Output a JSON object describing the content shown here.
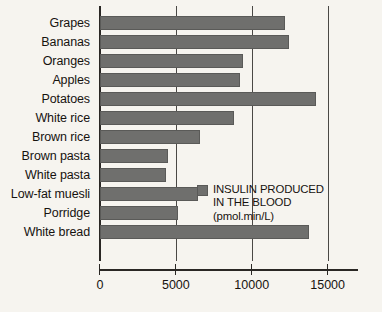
{
  "chart_data": {
    "type": "bar",
    "orientation": "horizontal",
    "title": "",
    "xlabel": "",
    "ylabel": "",
    "xlim": [
      0,
      17000
    ],
    "xticks": [
      0,
      5000,
      10000,
      15000
    ],
    "xtick_labels": [
      "0",
      "5000",
      "10000",
      "15000"
    ],
    "grid": "vertical",
    "legend_position": "inside-right",
    "categories": [
      "Grapes",
      "Bananas",
      "Oranges",
      "Apples",
      "Potatoes",
      "White rice",
      "Brown rice",
      "Brown pasta",
      "White pasta",
      "Low-fat muesli",
      "Porridge",
      "White bread"
    ],
    "values": [
      12200,
      12450,
      9450,
      9200,
      14200,
      8800,
      6600,
      4500,
      4350,
      6450,
      5150,
      13800
    ],
    "series": [
      {
        "name": "INSULIN PRODUCED IN THE BLOOD (pmol.min/L)",
        "color": "#6f6f6d",
        "values": [
          12200,
          12450,
          9450,
          9200,
          14200,
          8800,
          6600,
          4500,
          4350,
          6450,
          5150,
          13800
        ]
      }
    ]
  },
  "legend": {
    "swatch_color": "#6f6f6d",
    "line1": "INSULIN PRODUCED",
    "line2": "IN THE BLOOD",
    "line3": "(pmol.min/L)"
  },
  "colors": {
    "background": "#f6f4ef",
    "bar": "#6f6f6d",
    "axis": "#2a2724",
    "grid": "#4a4845",
    "text": "#16130f"
  }
}
